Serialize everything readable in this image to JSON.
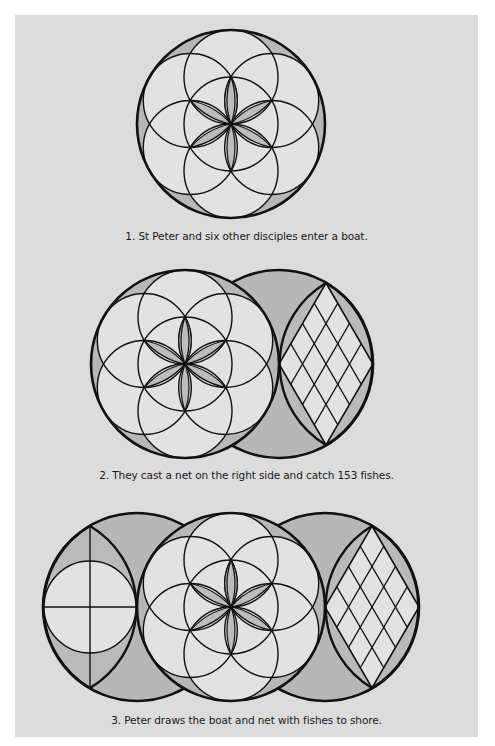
{
  "page": {
    "background_color": "#dcdcdc",
    "shade_color": "#b4b4b4",
    "light_color": "#e4e4e4",
    "line_color": "#111111"
  },
  "figures": [
    {
      "id": "figure-1",
      "caption": "1. St Peter and six other disciples enter a boat.",
      "elements": [
        "seed-of-life circle"
      ]
    },
    {
      "id": "figure-2",
      "caption": "2. They cast a net on the right side and catch 153 fishes.",
      "elements": [
        "seed-of-life circle",
        "net lens with lattice"
      ]
    },
    {
      "id": "figure-3",
      "caption": "3. Peter draws the boat and net with fishes to shore.",
      "elements": [
        "boat lens with circle and cross",
        "flower circle",
        "net lens with lattice"
      ]
    }
  ]
}
